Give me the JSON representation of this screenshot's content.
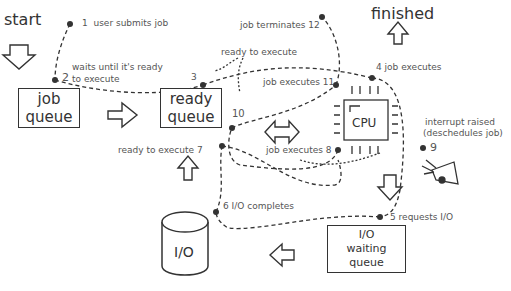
{
  "title_start": "start",
  "title_finished": "finished",
  "boxes": {
    "job_queue": [
      "job",
      "queue"
    ],
    "ready_queue": [
      "ready",
      "queue"
    ],
    "cpu": "CPU",
    "io_device": "I/O",
    "io_waiting": [
      "I/O",
      "waiting queue"
    ]
  },
  "steps": [
    {
      "n": "1",
      "text": "user submits job"
    },
    {
      "n": "2",
      "text": "waits until it's ready"
    },
    {
      "n": "2b",
      "text": "to execute"
    },
    {
      "n": "3",
      "text": "3"
    },
    {
      "n": "3a",
      "text": "ready to execute"
    },
    {
      "n": "4",
      "text": "4  job executes"
    },
    {
      "n": "5",
      "text": "5  requests I/O"
    },
    {
      "n": "6",
      "text": "6  I/O completes"
    },
    {
      "n": "7",
      "text": "ready to execute 7"
    },
    {
      "n": "8",
      "text": "job executes 8"
    },
    {
      "n": "9",
      "text": "9"
    },
    {
      "n": "9a",
      "text": "interrupt raised"
    },
    {
      "n": "9b",
      "text": "(deschedules job)"
    },
    {
      "n": "10",
      "text": "10"
    },
    {
      "n": "11",
      "text": "job executes 11"
    },
    {
      "n": "12",
      "text": "job terminates  12"
    }
  ],
  "colors": {
    "ink": "#333333",
    "label": "#555555",
    "background": "#ffffff"
  }
}
